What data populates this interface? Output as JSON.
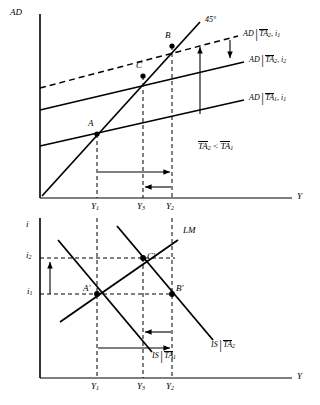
{
  "figure": {
    "type": "economics-diagram"
  },
  "top_chart": {
    "y_axis_label": "AD",
    "x_axis_label": "Y",
    "x_ticks": [
      "Y",
      "Y",
      "Y"
    ],
    "x_tick_subs": [
      "1",
      "3",
      "2"
    ],
    "line45_label": "45°",
    "points": [
      {
        "name": "A",
        "x_tick": "Y1"
      },
      {
        "name": "C",
        "x_tick": "Y3"
      },
      {
        "name": "B",
        "x_tick": "Y2"
      }
    ],
    "curves": [
      {
        "id": "ad-ta2-i1",
        "base": "AD",
        "cond_var": "TA",
        "cond_sub": "2",
        "rate": "i",
        "rate_sub": "1",
        "style": "dashed"
      },
      {
        "id": "ad-ta2-i2",
        "base": "AD",
        "cond_var": "TA",
        "cond_sub": "2",
        "rate": "i",
        "rate_sub": "2",
        "style": "solid"
      },
      {
        "id": "ad-ta1-i1",
        "base": "AD",
        "cond_var": "TA",
        "cond_sub": "1",
        "rate": "i",
        "rate_sub": "1",
        "style": "solid"
      }
    ],
    "inequality": {
      "left_var": "TA",
      "left_sub": "2",
      "op": "<",
      "right_var": "TA",
      "right_sub": "1"
    }
  },
  "bottom_chart": {
    "y_axis_label": "i",
    "x_axis_label": "Y",
    "x_ticks": [
      "Y",
      "Y",
      "Y"
    ],
    "x_tick_subs": [
      "1",
      "3",
      "2"
    ],
    "y_ticks": [
      {
        "label": "i",
        "sub": "2"
      },
      {
        "label": "i",
        "sub": "1"
      }
    ],
    "lm_label": "LM",
    "points": [
      {
        "name": "A'",
        "x_tick": "Y1"
      },
      {
        "name": "C'",
        "x_tick": "Y3"
      },
      {
        "name": "B'",
        "x_tick": "Y2"
      }
    ],
    "curves": [
      {
        "id": "is-ta1",
        "base": "IS",
        "cond_var": "TA",
        "cond_sub": "1"
      },
      {
        "id": "is-ta2",
        "base": "IS",
        "cond_var": "TA",
        "cond_sub": "2"
      }
    ]
  },
  "colors": {
    "ink": "#000000",
    "background": "#ffffff"
  }
}
